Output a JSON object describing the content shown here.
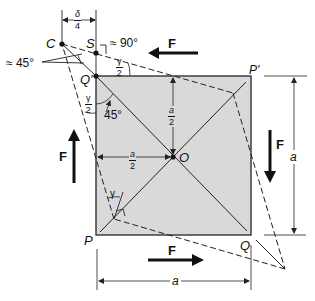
{
  "figure": {
    "type": "shear-deformation-diagram",
    "colors": {
      "square_fill": "#d9d9d9",
      "square_stroke": "#333333",
      "line": "#222222",
      "background": "#ffffff"
    },
    "points": {
      "C": "C",
      "S": "S",
      "Q_prime": "Q'",
      "P_prime": "P'",
      "O": "O",
      "P": "P",
      "Q": "Q"
    },
    "angles": {
      "approx_45": "≈ 45°",
      "approx_90": "≈ 90°",
      "gamma_half_top": {
        "num": "γ",
        "den": "2"
      },
      "gamma_half_left": {
        "num": "γ",
        "den": "2"
      },
      "forty_five": "45°",
      "gamma": "γ"
    },
    "dimensions": {
      "delta_quarter": {
        "num": "δ",
        "den": "4"
      },
      "a_half_vertical": {
        "num": "a",
        "den": "2"
      },
      "a_half_horizontal": {
        "num": "a",
        "den": "2"
      },
      "a_right": "a",
      "a_bottom": "a"
    },
    "forces": {
      "top": "F",
      "bottom": "F",
      "left": "F",
      "right": "F"
    }
  }
}
